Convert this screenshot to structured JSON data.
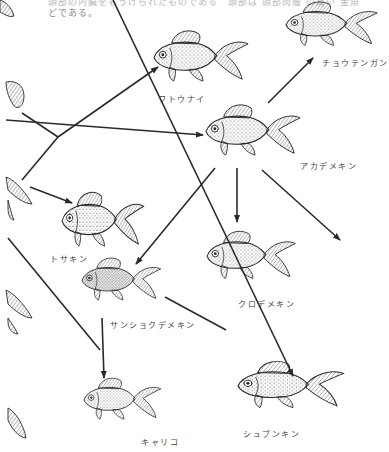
{
  "page": {
    "caption_left_line1": "頭部の内臓をもうけられたものである",
    "caption_left_line2": "どである。",
    "caption_right_line1": "頭部は 頭部肉瘤 の高い 金魚"
  },
  "diagram": {
    "nodes": [
      {
        "id": "wakin_frag_top",
        "label": "",
        "note": "partial fish at left edge (cropped)"
      },
      {
        "id": "watonai",
        "label": "ワトウナイ"
      },
      {
        "id": "chotengan",
        "label": "チョウテンガン"
      },
      {
        "id": "akademekin",
        "label": "アカデメキン"
      },
      {
        "id": "tosakin",
        "label": "トサキン"
      },
      {
        "id": "kurodemekin",
        "label": "クロデメキン"
      },
      {
        "id": "sanshokudemekin",
        "label": "サンショクデメキン"
      },
      {
        "id": "kyariko",
        "label": "キャリコ"
      },
      {
        "id": "shubunkin",
        "label": "シュブンキン"
      }
    ],
    "edges": [
      {
        "from": "left_edge_mid",
        "to": "watonai"
      },
      {
        "from": "left_edge_mid",
        "to": "akademekin"
      },
      {
        "from": "left_edge_lower",
        "to": "tosakin"
      },
      {
        "from": "akademekin",
        "to": "chotengan"
      },
      {
        "from": "akademekin",
        "to": "kurodemekin"
      },
      {
        "from": "akademekin",
        "to": "sanshokudemekin"
      },
      {
        "from": "akademekin",
        "to": "offpage_lower_right"
      },
      {
        "from": "sanshokudemekin",
        "to": "kyariko"
      },
      {
        "from": "sanshokudemekin",
        "to": "shubunkin"
      },
      {
        "from": "top_left",
        "to": "shubunkin"
      },
      {
        "from": "left_edge_lower",
        "to": "kyariko"
      }
    ]
  },
  "colors": {
    "line": "#2a2a2a",
    "fish_outline": "#2a2a2a",
    "caption": "#8a8a8a",
    "background": "#ffffff"
  }
}
